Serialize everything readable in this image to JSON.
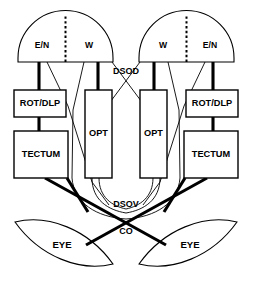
{
  "diagram": {
    "colors": {
      "stroke": "#000000",
      "fill": "#ffffff",
      "background": "#ffffff"
    },
    "domes": {
      "left": {
        "name": "left-pretectum-dome",
        "segments": [
          {
            "label": "E/N"
          },
          {
            "label": "W"
          }
        ]
      },
      "right": {
        "name": "right-pretectum-dome",
        "segments": [
          {
            "label": "W"
          },
          {
            "label": "E/N"
          }
        ]
      }
    },
    "nuclei": {
      "left_rot_dlp": "ROT/DLP",
      "left_tectum": "TECTUM",
      "left_opt": "OPT",
      "right_opt": "OPT",
      "right_rot_dlp": "ROT/DLP",
      "right_tectum": "TECTUM"
    },
    "eyes": {
      "left": "EYE",
      "right": "EYE"
    },
    "pathways": {
      "dsod": "DSOD",
      "dsov": "DSOV",
      "co": "CO"
    }
  }
}
